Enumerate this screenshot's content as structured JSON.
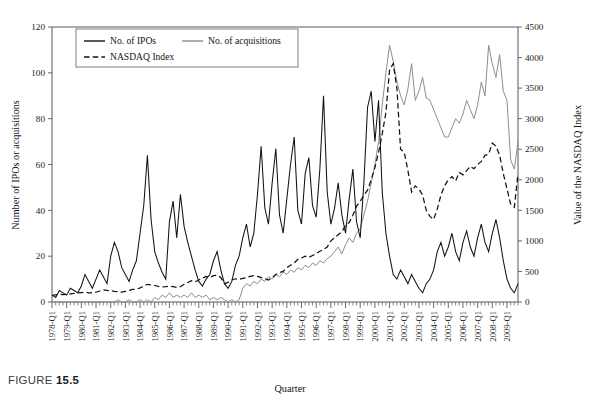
{
  "caption": {
    "prefix": "FIGURE",
    "number": "15.5"
  },
  "chart_data": {
    "type": "line",
    "title": "",
    "xlabel": "Quarter",
    "ylabel": "Number of IPOs or acquisitions",
    "y2label": "Value of the NASDAQ Index",
    "ylim": [
      0,
      120
    ],
    "y2lim": [
      0,
      4500
    ],
    "yticks": [
      0,
      20,
      40,
      60,
      80,
      100,
      120
    ],
    "y2ticks": [
      0,
      500,
      1000,
      1500,
      2000,
      2500,
      3000,
      3500,
      4000,
      4500
    ],
    "grid": false,
    "legend_position": "top-left-inside",
    "legend": [
      "No. of IPOs",
      "No. of acquisitions",
      "NASDAQ Index"
    ],
    "x_tick_labels": [
      "1978-Q1",
      "1979-Q1",
      "1980-Q1",
      "1981-Q1",
      "1982-Q1",
      "1983-Q1",
      "1984-Q1",
      "1985-Q1",
      "1986-Q1",
      "1987-Q1",
      "1988-Q1",
      "1989-Q1",
      "1990-Q1",
      "1991-Q1",
      "1992-Q1",
      "1993-Q1",
      "1994-Q1",
      "1995-Q1",
      "1996-Q1",
      "1997-Q1",
      "1998-Q1",
      "1999-Q1",
      "2000-Q1",
      "2001-Q1",
      "2002-Q1",
      "2003-Q1",
      "2004-Q1",
      "2005-Q1",
      "2006-Q1",
      "2007-Q1",
      "2008-Q1",
      "2009-Q1"
    ],
    "x_start": "1978-Q1",
    "x_end": "2009-Q4",
    "x_frequency": "quarterly",
    "n_points": 128,
    "series": [
      {
        "name": "No. of IPOs",
        "axis": "left",
        "style": "solid",
        "color": "#121212",
        "values": [
          3,
          2,
          5,
          4,
          3,
          6,
          5,
          4,
          7,
          12,
          9,
          6,
          10,
          14,
          11,
          8,
          20,
          26,
          22,
          15,
          12,
          9,
          14,
          18,
          30,
          42,
          64,
          36,
          22,
          17,
          13,
          10,
          35,
          44,
          28,
          47,
          33,
          26,
          20,
          14,
          9,
          7,
          10,
          12,
          18,
          22,
          14,
          8,
          6,
          9,
          16,
          20,
          28,
          34,
          24,
          30,
          47,
          68,
          41,
          34,
          52,
          67,
          38,
          30,
          45,
          60,
          72,
          40,
          34,
          56,
          63,
          42,
          37,
          58,
          90,
          48,
          34,
          41,
          52,
          38,
          30,
          45,
          58,
          35,
          28,
          52,
          85,
          92,
          70,
          88,
          48,
          30,
          20,
          12,
          10,
          14,
          11,
          8,
          12,
          9,
          6,
          4,
          8,
          10,
          14,
          22,
          26,
          20,
          24,
          30,
          22,
          18,
          26,
          31,
          24,
          20,
          28,
          34,
          26,
          22,
          30,
          36,
          28,
          18,
          10,
          6,
          4,
          8
        ]
      },
      {
        "name": "No. of acquisitions",
        "axis": "left",
        "style": "solid",
        "color": "#8a8f93",
        "values": [
          0,
          0,
          0,
          0,
          0,
          0,
          0,
          0,
          0,
          0,
          0,
          0,
          0,
          0,
          0,
          0,
          0,
          0,
          1,
          0,
          0,
          1,
          0,
          0,
          1,
          0,
          1,
          0,
          2,
          1,
          3,
          2,
          4,
          2,
          3,
          2,
          3,
          2,
          4,
          2,
          3,
          2,
          3,
          1,
          2,
          1,
          2,
          1,
          0,
          1,
          0,
          1,
          6,
          8,
          7,
          9,
          8,
          10,
          9,
          11,
          10,
          12,
          11,
          13,
          12,
          14,
          13,
          15,
          14,
          16,
          15,
          17,
          16,
          18,
          17,
          19,
          20,
          22,
          24,
          21,
          25,
          28,
          26,
          30,
          32,
          38,
          44,
          52,
          60,
          70,
          86,
          100,
          112,
          105,
          96,
          90,
          86,
          93,
          104,
          88,
          92,
          98,
          89,
          88,
          84,
          80,
          76,
          72,
          72,
          76,
          80,
          78,
          82,
          88,
          84,
          80,
          86,
          96,
          90,
          112,
          104,
          98,
          108,
          92,
          88,
          62,
          58,
          70
        ]
      },
      {
        "name": "NASDAQ Index",
        "axis": "right",
        "style": "dashed",
        "color": "#121212",
        "values": [
          110,
          118,
          126,
          120,
          125,
          132,
          140,
          150,
          155,
          160,
          150,
          148,
          160,
          180,
          200,
          190,
          185,
          175,
          168,
          160,
          175,
          190,
          205,
          210,
          230,
          260,
          290,
          280,
          270,
          255,
          245,
          250,
          260,
          250,
          240,
          250,
          290,
          320,
          350,
          330,
          360,
          390,
          420,
          400,
          430,
          440,
          400,
          300,
          320,
          360,
          380,
          370,
          385,
          400,
          420,
          430,
          420,
          400,
          380,
          360,
          400,
          450,
          480,
          500,
          560,
          600,
          640,
          700,
          720,
          750,
          730,
          760,
          790,
          830,
          860,
          900,
          1000,
          1050,
          1100,
          1150,
          1250,
          1300,
          1420,
          1570,
          1650,
          1750,
          1830,
          2000,
          2200,
          2450,
          2750,
          3100,
          3800,
          3900,
          3500,
          2500,
          2450,
          2150,
          1800,
          1900,
          1850,
          1750,
          1500,
          1400,
          1350,
          1520,
          1750,
          1900,
          2000,
          2050,
          1980,
          2120,
          2080,
          2150,
          2220,
          2180,
          2250,
          2300,
          2400,
          2420,
          2600,
          2550,
          2400,
          2100,
          1850,
          1600,
          1550,
          2100
        ]
      }
    ]
  }
}
